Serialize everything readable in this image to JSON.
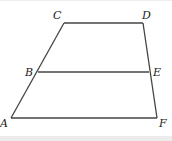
{
  "diagram": {
    "type": "trapezoid",
    "stroke_color": "#444444",
    "points": {
      "A": {
        "label": "A",
        "x": 11,
        "y": 118,
        "lx": 0,
        "ly": 127
      },
      "B": {
        "label": "B",
        "x": 38,
        "y": 72,
        "lx": 25,
        "ly": 76
      },
      "C": {
        "label": "C",
        "x": 64,
        "y": 23,
        "lx": 53,
        "ly": 19
      },
      "D": {
        "label": "D",
        "x": 143,
        "y": 23,
        "lx": 142,
        "ly": 19
      },
      "E": {
        "label": "E",
        "x": 149,
        "y": 72,
        "lx": 153,
        "ly": 76
      },
      "F": {
        "label": "F",
        "x": 157,
        "y": 118,
        "lx": 159,
        "ly": 127
      }
    },
    "segments": [
      [
        "A",
        "C"
      ],
      [
        "C",
        "D"
      ],
      [
        "D",
        "F"
      ],
      [
        "F",
        "A"
      ],
      [
        "B",
        "E"
      ]
    ]
  }
}
